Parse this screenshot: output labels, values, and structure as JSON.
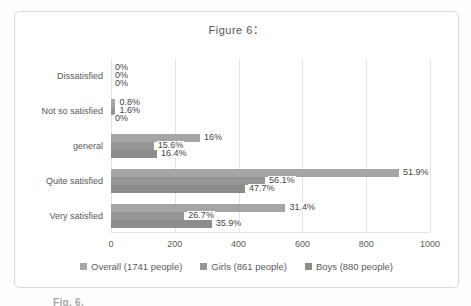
{
  "title": "Figure 6：",
  "caption_partial": "Fig. 6.",
  "colors": {
    "frame_border": "#d8d8d8",
    "gridline": "#e2e2e2",
    "axis_text": "#595959",
    "overall_bar": "#a5a5a5",
    "girls_bar": "#969696",
    "boys_bar": "#8c8c8c"
  },
  "chart_data": {
    "type": "bar",
    "orientation": "horizontal",
    "title": "Figure 6：",
    "categories": [
      "Dissatisfied",
      "Not so satisfied",
      "general",
      "Quite satisfied",
      "Very satisfied"
    ],
    "x_axis": {
      "min": 0,
      "max": 1000,
      "ticks": [
        0,
        200,
        400,
        600,
        800,
        1000
      ]
    },
    "gridlines": true,
    "legend_position": "bottom",
    "series": [
      {
        "key": "overall",
        "name": "Overall (1741 people)",
        "color": "#a5a5a5",
        "labels": [
          "0%",
          "0.8%",
          "16%",
          "51.9%",
          "31.4%"
        ],
        "counts": [
          0,
          14,
          279,
          903,
          547
        ]
      },
      {
        "key": "girls",
        "name": "Girls (861 people)",
        "color": "#969696",
        "labels": [
          "0%",
          "1.6%",
          "15.6%",
          "56.1%",
          "26.7%"
        ],
        "counts": [
          0,
          14,
          134,
          483,
          230
        ]
      },
      {
        "key": "boys",
        "name": "Boys (880 people)",
        "color": "#8c8c8c",
        "labels": [
          "0%",
          "0%",
          "16.4%",
          "47.7%",
          "35.9%"
        ],
        "counts": [
          0,
          0,
          144,
          420,
          316
        ]
      }
    ]
  }
}
